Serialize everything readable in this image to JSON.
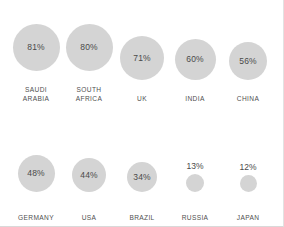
{
  "chart_data": {
    "type": "bar",
    "subtype": "bubble-proportional-circles",
    "title": "",
    "subtitle": "",
    "xlabel": "",
    "ylabel": "",
    "unit": "%",
    "grid": false,
    "legend": "none",
    "layout": {
      "rows": 2,
      "columns": 5
    },
    "colors": {
      "bubble_fill": "#d4d4d4",
      "value_text": "#4a4a4a",
      "label_text": "#4f4f4f",
      "background": "#ffffff",
      "border": "#e2e2e2"
    },
    "categories": [
      "SAUDI ARABIA",
      "SOUTH AFRICA",
      "UK",
      "INDIA",
      "CHINA",
      "GERMANY",
      "USA",
      "BRAZIL",
      "RUSSIA",
      "JAPAN"
    ],
    "values": [
      81,
      80,
      71,
      60,
      56,
      48,
      44,
      34,
      13,
      12
    ],
    "ylim": [
      0,
      100
    ]
  },
  "rows": [
    {
      "id": "row-1",
      "cells": [
        {
          "label": "SAUDI\nARABIA",
          "value": 81,
          "value_text": "81%",
          "size": 47,
          "value_position": "inside"
        },
        {
          "label": "SOUTH\nAFRICA",
          "value": 80,
          "value_text": "80%",
          "size": 47,
          "value_position": "inside"
        },
        {
          "label": "UK",
          "value": 71,
          "value_text": "71%",
          "size": 44,
          "value_position": "inside"
        },
        {
          "label": "INDIA",
          "value": 60,
          "value_text": "60%",
          "size": 41,
          "value_position": "inside"
        },
        {
          "label": "CHINA",
          "value": 56,
          "value_text": "56%",
          "size": 38,
          "value_position": "inside"
        }
      ]
    },
    {
      "id": "row-2",
      "cells": [
        {
          "label": "GERMANY",
          "value": 48,
          "value_text": "48%",
          "size": 37,
          "value_position": "inside"
        },
        {
          "label": "USA",
          "value": 44,
          "value_text": "44%",
          "size": 34,
          "value_position": "inside"
        },
        {
          "label": "BRAZIL",
          "value": 34,
          "value_text": "34%",
          "size": 30,
          "value_position": "inside"
        },
        {
          "label": "RUSSIA",
          "value": 13,
          "value_text": "13%",
          "size": 18,
          "value_position": "outside"
        },
        {
          "label": "JAPAN",
          "value": 12,
          "value_text": "12%",
          "size": 17,
          "value_position": "outside"
        }
      ]
    }
  ]
}
